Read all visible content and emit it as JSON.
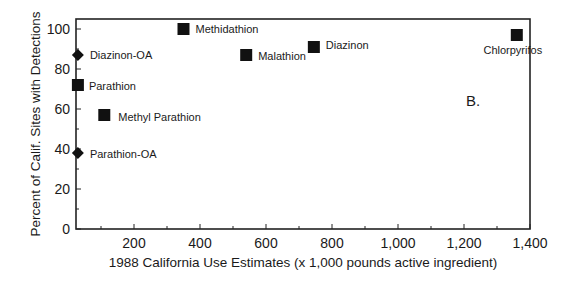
{
  "chart_data": {
    "type": "scatter",
    "title": "",
    "panel_label": "B.",
    "xlabel": "1988 California Use Estimates (x 1,000 pounds active ingredient)",
    "ylabel": "Percent of Calif. Sites with Detections",
    "xlim": [
      25,
      1400
    ],
    "ylim": [
      0,
      105
    ],
    "x_ticks": [
      200,
      400,
      600,
      800,
      1000,
      1200,
      1400
    ],
    "x_tick_labels": [
      "200",
      "400",
      "600",
      "800",
      "1,000",
      "1,200",
      "1,400"
    ],
    "y_ticks": [
      0,
      20,
      40,
      60,
      80,
      100
    ],
    "y_tick_labels": [
      "0",
      "20",
      "40",
      "60",
      "80",
      "100"
    ],
    "grid": false,
    "legend": null,
    "points": [
      {
        "name": "Methidathion",
        "x": 350,
        "y": 100,
        "marker": "square"
      },
      {
        "name": "Diazinon-OA",
        "x": 30,
        "y": 87,
        "marker": "diamond"
      },
      {
        "name": "Malathion",
        "x": 540,
        "y": 87,
        "marker": "square"
      },
      {
        "name": "Diazinon",
        "x": 745,
        "y": 91,
        "marker": "square"
      },
      {
        "name": "Chlorpyrifos",
        "x": 1360,
        "y": 97,
        "marker": "square"
      },
      {
        "name": "Parathion",
        "x": 30,
        "y": 72,
        "marker": "square"
      },
      {
        "name": "Methyl Parathion",
        "x": 110,
        "y": 57,
        "marker": "square"
      },
      {
        "name": "Parathion-OA",
        "x": 30,
        "y": 38,
        "marker": "diamond"
      }
    ]
  },
  "colors": {
    "marker": "#111111",
    "axis": "#222222",
    "background": "#ffffff"
  }
}
